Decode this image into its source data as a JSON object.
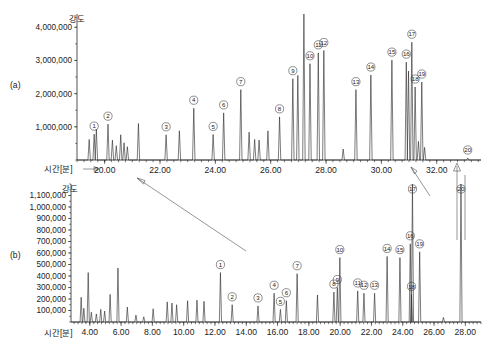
{
  "figure": {
    "panel_a_label": "(a)",
    "panel_b_label": "(b)",
    "y_axis_title": "강도",
    "x_axis_title": "시간[분]",
    "stroke_color": "#2a2a2a",
    "label_color": "#222222"
  },
  "chart_data": [
    {
      "id": "panel-a",
      "type": "line",
      "title": "(a)",
      "xlabel": "시간[분]",
      "ylabel": "강도",
      "xlim": [
        19.0,
        33.6
      ],
      "ylim": [
        0,
        4400000
      ],
      "grid": false,
      "legend": null,
      "xticks": [
        20.0,
        22.0,
        24.0,
        26.0,
        28.0,
        30.0,
        32.0
      ],
      "xticklabels": [
        "20.00",
        "22.00",
        "24.00",
        "26.00",
        "28.00",
        "30.00",
        "32.00"
      ],
      "yticks": [
        1000000,
        2000000,
        3000000,
        4000000
      ],
      "yticklabels": [
        "1,000,000",
        "2,000,000",
        "3,000,000",
        "4,000,000"
      ],
      "labeled_peaks": [
        {
          "n": "1",
          "x": 19.62,
          "y": 780000
        },
        {
          "n": "2",
          "x": 20.12,
          "y": 1080000
        },
        {
          "n": "3",
          "x": 22.22,
          "y": 760000
        },
        {
          "n": "4",
          "x": 23.22,
          "y": 1560000
        },
        {
          "n": "5",
          "x": 23.92,
          "y": 770000
        },
        {
          "n": "6",
          "x": 24.3,
          "y": 1420000
        },
        {
          "n": "7",
          "x": 24.92,
          "y": 2120000
        },
        {
          "n": "8",
          "x": 26.32,
          "y": 1300000
        },
        {
          "n": "9",
          "x": 26.8,
          "y": 2450000
        },
        {
          "n": "10",
          "x": 27.42,
          "y": 2900000
        },
        {
          "n": "11",
          "x": 27.72,
          "y": 3230000
        },
        {
          "n": "12",
          "x": 27.92,
          "y": 3300000
        },
        {
          "n": "13",
          "x": 29.08,
          "y": 2120000
        },
        {
          "n": "14",
          "x": 29.62,
          "y": 2560000
        },
        {
          "n": "15",
          "x": 30.38,
          "y": 3010000
        },
        {
          "n": "16",
          "x": 30.9,
          "y": 2950000
        },
        {
          "n": "17",
          "x": 31.1,
          "y": 3550000
        },
        {
          "n": "18",
          "x": 31.22,
          "y": 2200000
        },
        {
          "n": "19",
          "x": 31.46,
          "y": 2350000
        },
        {
          "n": "20",
          "x": 33.12,
          "y": 60000
        }
      ],
      "unlabeled_peaks": [
        {
          "x": 19.44,
          "y": 620000
        },
        {
          "x": 19.7,
          "y": 930000
        },
        {
          "x": 20.28,
          "y": 600000
        },
        {
          "x": 20.42,
          "y": 430000
        },
        {
          "x": 20.58,
          "y": 760000
        },
        {
          "x": 20.7,
          "y": 520000
        },
        {
          "x": 20.82,
          "y": 400000
        },
        {
          "x": 21.22,
          "y": 1100000
        },
        {
          "x": 22.7,
          "y": 880000
        },
        {
          "x": 25.22,
          "y": 840000
        },
        {
          "x": 25.42,
          "y": 620000
        },
        {
          "x": 25.58,
          "y": 600000
        },
        {
          "x": 25.9,
          "y": 880000
        },
        {
          "x": 26.98,
          "y": 2550000
        },
        {
          "x": 27.2,
          "y": 4400000
        },
        {
          "x": 28.62,
          "y": 330000
        },
        {
          "x": 30.98,
          "y": 2680000
        },
        {
          "x": 31.34,
          "y": 560000
        },
        {
          "x": 31.56,
          "y": 380000
        }
      ]
    },
    {
      "id": "panel-b",
      "type": "line",
      "title": "(b)",
      "xlabel": "시간[분]",
      "ylabel": "강도",
      "xlim": [
        2.8,
        29.0
      ],
      "ylim": [
        0,
        1200000
      ],
      "grid": false,
      "legend": null,
      "xticks": [
        4.0,
        6.0,
        8.0,
        10.0,
        12.0,
        14.0,
        16.0,
        18.0,
        20.0,
        22.0,
        24.0,
        26.0,
        28.0
      ],
      "xticklabels": [
        "4.00",
        "6.00",
        "8.00",
        "10.00",
        "12.00",
        "14.00",
        "16.00",
        "18.00",
        "20.00",
        "22.00",
        "24.00",
        "26.00",
        "28.00"
      ],
      "yticks": [
        100000,
        200000,
        300000,
        400000,
        500000,
        600000,
        700000,
        800000,
        900000,
        1000000,
        1100000
      ],
      "yticklabels": [
        "100,000",
        "200,000",
        "300,000",
        "400,000",
        "500,000",
        "600,000",
        "700,000",
        "800,000",
        "900,000",
        "1,000,000",
        "1,100,000"
      ],
      "labeled_peaks": [
        {
          "n": "1",
          "x": 12.35,
          "y": 430000
        },
        {
          "n": "2",
          "x": 13.1,
          "y": 150000
        },
        {
          "n": "3",
          "x": 14.75,
          "y": 140000
        },
        {
          "n": "4",
          "x": 15.78,
          "y": 250000
        },
        {
          "n": "5",
          "x": 16.18,
          "y": 110000
        },
        {
          "n": "6",
          "x": 16.56,
          "y": 185000
        },
        {
          "n": "7",
          "x": 17.25,
          "y": 420000
        },
        {
          "n": "8",
          "x": 19.6,
          "y": 260000
        },
        {
          "n": "9",
          "x": 19.82,
          "y": 300000
        },
        {
          "n": "10",
          "x": 19.98,
          "y": 560000
        },
        {
          "n": "11",
          "x": 21.12,
          "y": 270000
        },
        {
          "n": "12",
          "x": 21.52,
          "y": 250000
        },
        {
          "n": "13",
          "x": 22.2,
          "y": 250000
        },
        {
          "n": "14",
          "x": 23.0,
          "y": 570000
        },
        {
          "n": "15",
          "x": 23.82,
          "y": 560000
        },
        {
          "n": "16",
          "x": 24.48,
          "y": 680000
        },
        {
          "n": "17",
          "x": 24.62,
          "y": 1200000
        },
        {
          "n": "18",
          "x": 24.56,
          "y": 240000
        },
        {
          "n": "19",
          "x": 25.08,
          "y": 610000
        },
        {
          "n": "20",
          "x": 27.72,
          "y": 1200000
        }
      ],
      "unlabeled_peaks": [
        {
          "x": 3.45,
          "y": 215000
        },
        {
          "x": 3.62,
          "y": 120000
        },
        {
          "x": 3.9,
          "y": 430000
        },
        {
          "x": 4.1,
          "y": 85000
        },
        {
          "x": 4.42,
          "y": 70000
        },
        {
          "x": 4.7,
          "y": 110000
        },
        {
          "x": 4.95,
          "y": 95000
        },
        {
          "x": 5.3,
          "y": 240000
        },
        {
          "x": 5.8,
          "y": 470000
        },
        {
          "x": 6.4,
          "y": 130000
        },
        {
          "x": 6.95,
          "y": 60000
        },
        {
          "x": 7.45,
          "y": 45000
        },
        {
          "x": 8.05,
          "y": 115000
        },
        {
          "x": 8.95,
          "y": 175000
        },
        {
          "x": 9.25,
          "y": 165000
        },
        {
          "x": 9.55,
          "y": 150000
        },
        {
          "x": 10.25,
          "y": 185000
        },
        {
          "x": 10.85,
          "y": 190000
        },
        {
          "x": 11.3,
          "y": 180000
        },
        {
          "x": 18.55,
          "y": 235000
        },
        {
          "x": 26.6,
          "y": 40000
        }
      ]
    }
  ],
  "annotations": {
    "diagonal_arrow_note": "arrow from panel b region up-left to 20.00 of panel a",
    "leader_to_peak17": "leader line from 32.00 area to peak 17",
    "vertical_arrows": 2
  }
}
